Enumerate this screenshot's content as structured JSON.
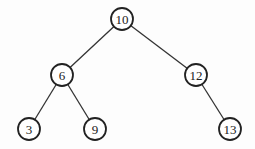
{
  "diagram": {
    "type": "binary-search-tree",
    "nodes": [
      {
        "id": "n10",
        "label": "10",
        "x": 122,
        "y": 19
      },
      {
        "id": "n6",
        "label": "6",
        "x": 62,
        "y": 75
      },
      {
        "id": "n12",
        "label": "12",
        "x": 196,
        "y": 75
      },
      {
        "id": "n3",
        "label": "3",
        "x": 29,
        "y": 129
      },
      {
        "id": "n9",
        "label": "9",
        "x": 95,
        "y": 129
      },
      {
        "id": "n13",
        "label": "13",
        "x": 230,
        "y": 129
      }
    ],
    "edges": [
      {
        "from": "n10",
        "to": "n6"
      },
      {
        "from": "n10",
        "to": "n12"
      },
      {
        "from": "n6",
        "to": "n3"
      },
      {
        "from": "n6",
        "to": "n9"
      },
      {
        "from": "n12",
        "to": "n13"
      }
    ],
    "node_radius": 11
  }
}
